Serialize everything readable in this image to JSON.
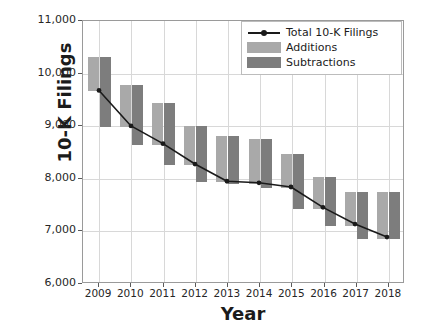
{
  "chart_data": {
    "type": "line",
    "title": "",
    "xlabel": "Year",
    "ylabel": "10-K Filings",
    "categories": [
      "2009",
      "2010",
      "2011",
      "2012",
      "2013",
      "2014",
      "2015",
      "2016",
      "2017",
      "2018"
    ],
    "x": [
      2009,
      2010,
      2011,
      2012,
      2013,
      2014,
      2015,
      2016,
      2017,
      2018
    ],
    "xlim": [
      2008.5,
      2018.5
    ],
    "ylim": [
      6000,
      11000
    ],
    "yticks": [
      6000,
      7000,
      8000,
      9000,
      10000,
      11000
    ],
    "ytick_labels": [
      "6,000",
      "7,000",
      "8,000",
      "9,000",
      "10,000",
      "11,000"
    ],
    "xtick_labels": [
      "2009",
      "2010",
      "2011",
      "2012",
      "2013",
      "2014",
      "2015",
      "2016",
      "2017",
      "2018"
    ],
    "grid": true,
    "legend_position": "upper right",
    "series": [
      {
        "name": "Total 10-K Filings",
        "type": "line",
        "marker": "circle",
        "color": "#1a1a1a",
        "values": [
          9670,
          8990,
          8650,
          8260,
          7930,
          7900,
          7820,
          7430,
          7110,
          6860
        ]
      },
      {
        "name": "Additions",
        "type": "floating-bar",
        "color": "#a9a9a9",
        "bar_bottom": [
          9670,
          8990,
          8650,
          8260,
          7930,
          7900,
          7820,
          7430,
          7110,
          6860
        ],
        "bar_top": [
          10320,
          9790,
          9440,
          9000,
          8820,
          8750,
          8480,
          8030,
          7740,
          7740
        ],
        "values": [
          650,
          800,
          790,
          740,
          890,
          850,
          660,
          600,
          630,
          880
        ]
      },
      {
        "name": "Subtractions",
        "type": "floating-bar",
        "color": "#7d7d7d",
        "bar_top": [
          10320,
          9790,
          9440,
          9000,
          8820,
          8750,
          8480,
          8030,
          7740,
          7740
        ],
        "bar_bottom": [
          8990,
          8650,
          8260,
          7930,
          7900,
          7820,
          7430,
          7110,
          6860,
          6860
        ],
        "values": [
          1330,
          1140,
          1180,
          1070,
          920,
          930,
          1050,
          920,
          880,
          880
        ]
      }
    ]
  },
  "legend": {
    "items": [
      {
        "label": "Total 10-K Filings",
        "key": "line-key"
      },
      {
        "label": "Additions",
        "key": "add-key"
      },
      {
        "label": "Subtractions",
        "key": "sub-key"
      }
    ]
  },
  "caption": "",
  "colors": {
    "additions": "#a9a9a9",
    "subtractions": "#7d7d7d",
    "line": "#1a1a1a",
    "grid": "#d8d8d8",
    "frame": "#9a9a9a"
  }
}
